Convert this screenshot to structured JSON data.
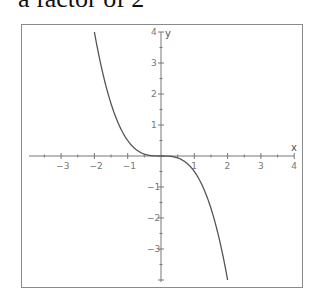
{
  "caption": "a factor of 2",
  "chart_data": {
    "type": "line",
    "title": "",
    "function": "y = -x^3 / 2",
    "xlabel": "x",
    "ylabel": "y",
    "xlim": [
      -4,
      4
    ],
    "ylim": [
      -4,
      4
    ],
    "x_ticks": [
      -3,
      -2,
      -1,
      1,
      2,
      3,
      4
    ],
    "y_ticks": [
      4,
      3,
      2,
      1,
      -1,
      -2,
      -3
    ],
    "grid": false,
    "legend": null,
    "series": [
      {
        "name": "f(x)",
        "x": [
          -2,
          -1.5,
          -1,
          -0.5,
          0,
          0.5,
          1,
          1.5,
          2
        ],
        "y": [
          4,
          1.6875,
          0.5,
          0.0625,
          0,
          -0.0625,
          -0.5,
          -1.6875,
          -4
        ]
      }
    ],
    "colors": {
      "curve": "#555555",
      "axes": "#777777",
      "frame": "#8a8a8a"
    }
  }
}
